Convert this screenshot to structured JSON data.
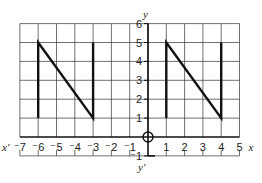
{
  "diagram": {
    "type": "coordinate-grid",
    "x_axis": {
      "label": "x",
      "neg_label": "x'",
      "min": -7,
      "max": 5,
      "ticks": [
        "-7",
        "-6",
        "-5",
        "-4",
        "-3",
        "-2",
        "-1",
        "1",
        "2",
        "3",
        "4",
        "5"
      ]
    },
    "y_axis": {
      "label": "y",
      "neg_label": "y'",
      "min": -1,
      "max": 6,
      "ticks": [
        "6",
        "5",
        "4",
        "3",
        "2",
        "1",
        "-1"
      ]
    },
    "origin_marker": "circle-crosshair",
    "shapes": [
      {
        "name": "N-left",
        "points": [
          [
            -6,
            1
          ],
          [
            -6,
            5
          ],
          [
            -3,
            1
          ],
          [
            -3,
            5
          ]
        ]
      },
      {
        "name": "N-right",
        "points": [
          [
            1,
            1
          ],
          [
            1,
            5
          ],
          [
            4,
            1
          ],
          [
            4,
            5
          ]
        ]
      }
    ],
    "colors": {
      "grid": "#333333",
      "shape": "#111111",
      "background": "#ffffff"
    }
  }
}
